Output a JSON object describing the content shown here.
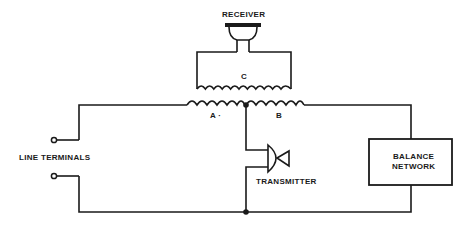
{
  "diagram": {
    "type": "telephone-hybrid-circuit",
    "labels": {
      "receiver": "RECEIVER",
      "coil_c": "C",
      "coil_a": "A ·",
      "coil_b": "B",
      "line_terminals": "LINE TERMINALS",
      "transmitter": "TRANSMITTER",
      "balance_network_line1": "BALANCE",
      "balance_network_line2": "NETWORK"
    },
    "components": [
      {
        "id": "receiver",
        "kind": "earpiece-icon"
      },
      {
        "id": "coil_c",
        "kind": "inductor",
        "label": "C"
      },
      {
        "id": "coil_a",
        "kind": "inductor",
        "label": "A"
      },
      {
        "id": "coil_b",
        "kind": "inductor",
        "label": "B"
      },
      {
        "id": "transmitter",
        "kind": "microphone-icon"
      },
      {
        "id": "balance_network",
        "kind": "box"
      },
      {
        "id": "line_terminals",
        "kind": "terminal-pair"
      }
    ],
    "colors": {
      "ink": "#1a1a1a",
      "background": "#ffffff"
    }
  }
}
